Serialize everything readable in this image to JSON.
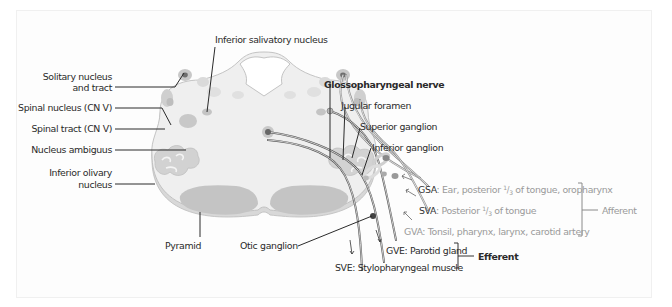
{
  "figure": {
    "title": "Glossopharyngeal nerve",
    "labels_left": {
      "solitary_line1": "Solitary nucleus",
      "solitary_line2": "and tract",
      "spinal_nucleus": "Spinal nucleus (CN V)",
      "spinal_tract": "Spinal tract (CN V)",
      "nucleus_ambiguus": "Nucleus ambiguus",
      "olivary_line1": "Inferior olivary",
      "olivary_line2": "nucleus"
    },
    "labels_top": {
      "inferior_salivatory": "Inferior salivatory nucleus"
    },
    "labels_bottom": {
      "pyramid": "Pyramid",
      "otic_ganglion": "Otic ganglion"
    },
    "labels_right": {
      "nerve": "Glossopharyngeal nerve",
      "jugular_foramen": "Jugular foramen",
      "superior_ganglion": "Superior ganglion",
      "inferior_ganglion": "Inferior ganglion"
    },
    "fibers": [
      {
        "abbr": "GSA",
        "sep": ":",
        "text_pre": " Ear, posterior ",
        "frac_num": "1",
        "frac_den": "3",
        "text_post": " of tongue, oropharynx",
        "group": "afferent"
      },
      {
        "abbr": "SVA",
        "sep": ":",
        "text_pre": " Posterior ",
        "frac_num": "1",
        "frac_den": "3",
        "text_post": " of tongue",
        "group": "afferent"
      },
      {
        "abbr": "GVA",
        "sep": ":",
        "text": " Tonsil, pharynx, larynx, carotid artery",
        "group": "afferent"
      },
      {
        "abbr": "GVE",
        "sep": ":",
        "text": " Parotid gland",
        "group": "efferent"
      },
      {
        "abbr": "SVE",
        "sep": ":",
        "text": " Stylopharyngeal muscle",
        "group": "efferent"
      }
    ],
    "groups": {
      "afferent": "Afferent",
      "efferent": "Efferent"
    },
    "colors": {
      "afferent_text": "#9a9a9a",
      "efferent_text": "#333333",
      "tissue": "#eeeeee",
      "nucleus": "#c8c8c8",
      "pyramid": "#c4c4c4"
    }
  }
}
